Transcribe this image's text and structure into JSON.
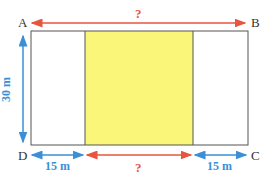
{
  "diagram": {
    "vertices": {
      "A": "A",
      "B": "B",
      "C": "C",
      "D": "D"
    },
    "top_length": "?",
    "bottom_middle_length": "?",
    "left_segment": "15 m",
    "right_segment": "15 m",
    "height": "30 m",
    "colors": {
      "red_arrow": "#e8553f",
      "blue_arrow": "#3a8fd6",
      "yellow_fill": "#faf67a",
      "outline": "#555555"
    }
  }
}
